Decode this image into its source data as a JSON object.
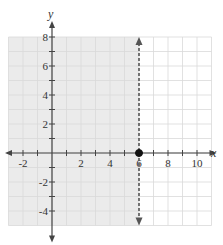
{
  "chart_data": {
    "type": "line",
    "title": "",
    "xlabel": "x",
    "ylabel": "y",
    "xlim": [
      -3,
      11
    ],
    "ylim": [
      -5,
      8
    ],
    "grid": true,
    "x_tick_labels": [
      "-2",
      "2",
      "4",
      "6",
      "8",
      "10"
    ],
    "x_ticks": [
      -2,
      2,
      4,
      6,
      8,
      10
    ],
    "y_tick_labels": [
      "8",
      "6",
      "4",
      "2",
      "-2",
      "-4"
    ],
    "y_ticks": [
      8,
      6,
      4,
      2,
      -2,
      -4
    ],
    "boundary_line": {
      "x": 6,
      "style": "dashed",
      "color": "#555555",
      "arrows": "both"
    },
    "shaded_region": {
      "side": "left",
      "x_max": 6,
      "color": "#e8e8e8"
    },
    "points": [
      {
        "x": 6,
        "y": 0,
        "style": "closed",
        "color": "#111111"
      }
    ],
    "colors": {
      "axis": "#444444",
      "grid": "#d9d9d9",
      "shade": "#ebebeb",
      "unshaded": "#ffffff"
    }
  }
}
